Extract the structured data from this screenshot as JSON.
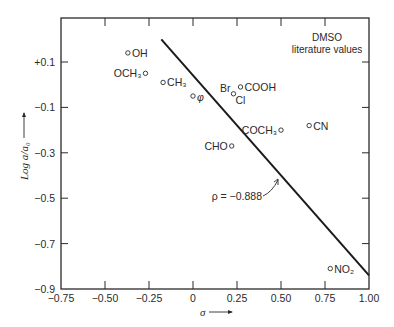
{
  "chart_data": {
    "type": "scatter",
    "title": "",
    "annotation": [
      "DMSO",
      "literature values"
    ],
    "xlabel": "σ →",
    "ylabel": "Log a/a₀ →",
    "xlim": [
      -0.75,
      1.0
    ],
    "ylim": [
      -0.9,
      0.2
    ],
    "xticks": [
      -0.75,
      -0.5,
      -0.25,
      0,
      0.25,
      0.5,
      0.75,
      1.0
    ],
    "xtick_labels": [
      "−0.75",
      "−0.50",
      "−0.25",
      "0",
      "0.25",
      "0.50",
      "0.75",
      "1.00"
    ],
    "yticks": [
      0.1,
      -0.1,
      -0.3,
      -0.5,
      -0.7,
      -0.9
    ],
    "ytick_labels": [
      "+0.1",
      "−0.1",
      "−0.3",
      "−0.5",
      "−0.7",
      "−0.9"
    ],
    "grid": false,
    "series": [
      {
        "name": "substituents",
        "points": [
          {
            "label": "OH",
            "x": -0.37,
            "y": 0.14
          },
          {
            "label": "OCH3",
            "x": -0.27,
            "y": 0.05
          },
          {
            "label": "CH3",
            "x": -0.17,
            "y": 0.01
          },
          {
            "label": "φ",
            "x": 0.0,
            "y": -0.05
          },
          {
            "label": "COOH",
            "x": 0.27,
            "y": -0.01
          },
          {
            "label": "Br",
            "x": 0.23,
            "y": -0.04
          },
          {
            "label": "Cl",
            "x": 0.23,
            "y": -0.04
          },
          {
            "label": "COCH3",
            "x": 0.5,
            "y": -0.2
          },
          {
            "label": "CHO",
            "x": 0.22,
            "y": -0.27
          },
          {
            "label": "CN",
            "x": 0.66,
            "y": -0.18
          },
          {
            "label": "NO2",
            "x": 0.78,
            "y": -0.81
          }
        ]
      },
      {
        "name": "fit line",
        "type": "line",
        "x": [
          -0.18,
          1.0
        ],
        "y": [
          0.2,
          -0.84
        ]
      }
    ],
    "fit_annotation": "ρ = −0.888"
  }
}
